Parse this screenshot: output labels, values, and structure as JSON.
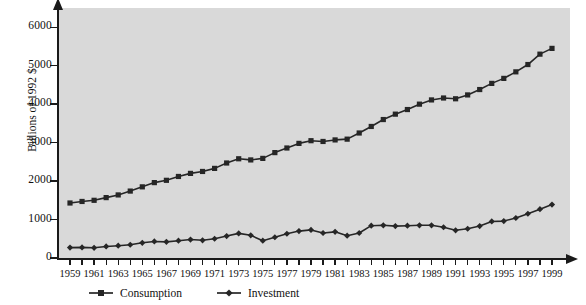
{
  "chart_data": {
    "type": "line",
    "title": "",
    "xlabel": "",
    "ylabel": "Billions of 1992 $",
    "xlim": [
      1959,
      1999
    ],
    "ylim": [
      0,
      6500
    ],
    "yticks": [
      0,
      1000,
      2000,
      3000,
      4000,
      5000,
      6000
    ],
    "ytick_labels": [
      "0",
      "1000",
      "2000",
      "3000",
      "4000",
      "5000",
      "6000"
    ],
    "x": [
      1959,
      1960,
      1961,
      1962,
      1963,
      1964,
      1965,
      1966,
      1967,
      1968,
      1969,
      1970,
      1971,
      1972,
      1973,
      1974,
      1975,
      1976,
      1977,
      1978,
      1979,
      1980,
      1981,
      1982,
      1983,
      1984,
      1985,
      1986,
      1987,
      1988,
      1989,
      1990,
      1991,
      1992,
      1993,
      1994,
      1995,
      1996,
      1997,
      1998,
      1999
    ],
    "xtick_labels": [
      "1959",
      "1960",
      "1961",
      "1962",
      "1963",
      "1964",
      "1965",
      "1966",
      "1967",
      "1968",
      "1969",
      "1970",
      "1971",
      "1972",
      "1973",
      "1974",
      "1975",
      "1976",
      "1977",
      "1978",
      "1979",
      "1980",
      "1981",
      "1982",
      "1983",
      "1984",
      "1985",
      "1986",
      "1987",
      "1988",
      "1989",
      "1990",
      "1991",
      "1992",
      "1993",
      "1994",
      "1995",
      "1996",
      "1997",
      "1998",
      "1999"
    ],
    "xtick_labels_shown": [
      "1959",
      "1961",
      "1963",
      "1965",
      "1967",
      "1969",
      "1971",
      "1973",
      "1975",
      "1977",
      "1979",
      "1981",
      "1983",
      "1985",
      "1987",
      "1989",
      "1991",
      "1993",
      "1995",
      "1997",
      "1999"
    ],
    "grid": false,
    "legend_position": "below-axis-left",
    "plot_background": "#d9d9d9",
    "axis_color": "#1a1a1a",
    "series": [
      {
        "name": "Consumption",
        "marker": "square",
        "color": "#262626",
        "values": [
          1430,
          1470,
          1500,
          1570,
          1640,
          1740,
          1850,
          1960,
          2020,
          2120,
          2200,
          2250,
          2330,
          2470,
          2580,
          2550,
          2590,
          2740,
          2860,
          2980,
          3050,
          3030,
          3070,
          3090,
          3250,
          3420,
          3600,
          3740,
          3860,
          4000,
          4110,
          4160,
          4140,
          4240,
          4380,
          4540,
          4670,
          4840,
          5030,
          5300,
          5450
        ]
      },
      {
        "name": "Investment",
        "marker": "diamond",
        "color": "#262626",
        "values": [
          270,
          275,
          265,
          300,
          320,
          345,
          395,
          430,
          420,
          450,
          480,
          460,
          500,
          570,
          640,
          590,
          450,
          540,
          630,
          700,
          730,
          650,
          680,
          580,
          650,
          840,
          850,
          830,
          840,
          850,
          850,
          800,
          720,
          760,
          830,
          950,
          960,
          1040,
          1150,
          1270,
          1390
        ]
      }
    ]
  },
  "legend": {
    "items": [
      {
        "label": "Consumption",
        "marker": "square"
      },
      {
        "label": "Investment",
        "marker": "diamond"
      }
    ]
  },
  "axis_titles": {
    "y": "Billions of 1992 $"
  }
}
